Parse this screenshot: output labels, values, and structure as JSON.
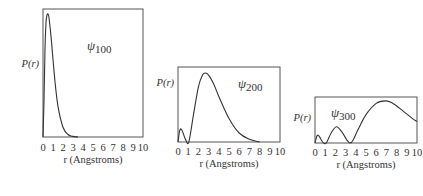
{
  "chart_data": [
    {
      "type": "line",
      "title": "ψ100",
      "orbital": {
        "symbol": "ψ",
        "sub": "100"
      },
      "xlabel": "r (Angstroms)",
      "ylabel": "P(r)",
      "xlim": [
        0,
        10
      ],
      "xticks": [
        "0",
        "1",
        "2",
        "3",
        "4",
        "5",
        "6",
        "7",
        "8",
        "9",
        "10"
      ],
      "grid": false,
      "x": [
        0,
        0.1,
        0.2,
        0.3,
        0.4,
        0.5,
        0.6,
        0.8,
        1.0,
        1.2,
        1.5,
        2.0,
        2.5,
        3.0,
        3.5
      ],
      "y": [
        0,
        0.3,
        0.72,
        0.93,
        0.99,
        1.0,
        0.97,
        0.82,
        0.63,
        0.45,
        0.25,
        0.08,
        0.02,
        0.005,
        0
      ]
    },
    {
      "type": "line",
      "title": "ψ200",
      "orbital": {
        "symbol": "ψ",
        "sub": "200"
      },
      "xlabel": "r (Angstroms)",
      "ylabel": "P(r)",
      "xlim": [
        0,
        10
      ],
      "xticks": [
        "0",
        "1",
        "2",
        "3",
        "4",
        "5",
        "6",
        "7",
        "8",
        "9",
        "10"
      ],
      "grid": false,
      "x": [
        0,
        0.15,
        0.3,
        0.5,
        0.75,
        1.06,
        1.5,
        2.0,
        2.4,
        2.7,
        3.0,
        3.5,
        4.0,
        5.0,
        6.0,
        7.0,
        8.0
      ],
      "y": [
        0,
        0.15,
        0.19,
        0.13,
        0.03,
        0,
        0.38,
        0.8,
        0.97,
        1.0,
        0.97,
        0.84,
        0.66,
        0.34,
        0.13,
        0.04,
        0
      ]
    },
    {
      "type": "line",
      "title": "ψ300",
      "orbital": {
        "symbol": "ψ",
        "sub": "300"
      },
      "xlabel": "r (Angstroms)",
      "ylabel": "P(r)",
      "xlim": [
        0,
        10
      ],
      "xticks": [
        "0",
        "1",
        "2",
        "3",
        "4",
        "5",
        "6",
        "7",
        "8",
        "9",
        "10"
      ],
      "grid": false,
      "x": [
        0,
        0.2,
        0.4,
        0.6,
        0.8,
        1.1,
        1.6,
        2.1,
        2.6,
        3.1,
        3.4,
        3.7,
        4.2,
        5.0,
        6.0,
        6.9,
        7.5,
        8.5,
        9.5,
        10
      ],
      "y": [
        0,
        0.17,
        0.16,
        0.08,
        0.01,
        0,
        0.24,
        0.38,
        0.27,
        0.08,
        0,
        0.05,
        0.3,
        0.66,
        0.92,
        0.98,
        0.94,
        0.77,
        0.58,
        0.5
      ]
    }
  ]
}
